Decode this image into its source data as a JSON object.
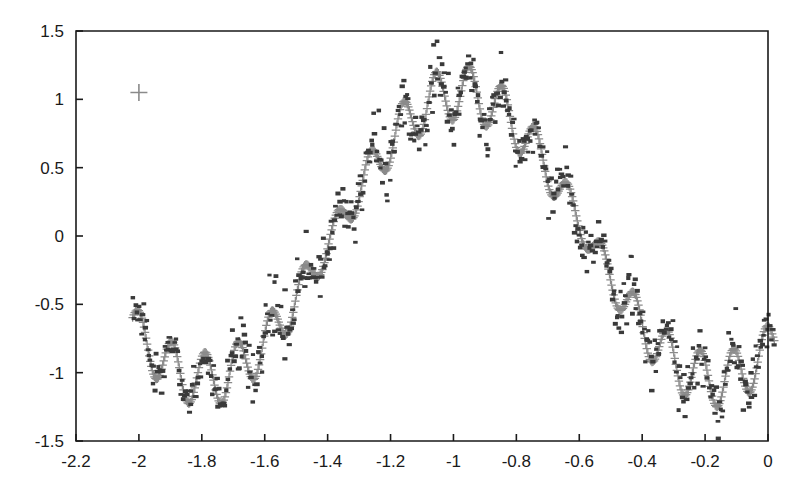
{
  "chart_data": {
    "type": "scatter",
    "title": "",
    "subtitle": "",
    "xlabel": "",
    "ylabel": "",
    "xlim": [
      -2.2,
      0
    ],
    "ylim": [
      -1.5,
      1.5
    ],
    "grid": false,
    "legend": "none",
    "x_ticks": [
      "-2.2",
      "-2",
      "-1.8",
      "-1.6",
      "-1.4",
      "-1.2",
      "-1",
      "-0.8",
      "-0.6",
      "-0.4",
      "-0.2",
      "0"
    ],
    "x_tick_values": [
      -2.2,
      -2,
      -1.8,
      -1.6,
      -1.4,
      -1.2,
      -1,
      -0.8,
      -0.6,
      -0.4,
      -0.2,
      0
    ],
    "y_ticks": [
      "1.5",
      "1",
      "0.5",
      "0",
      "-0.5",
      "-1",
      "-1.5"
    ],
    "y_tick_values": [
      1.5,
      1,
      0.5,
      0,
      -0.5,
      -1,
      -1.5
    ],
    "colors": {
      "fit_marker": "#8a8a8a",
      "data_marker": "#3a3a3a",
      "axis": "#1a1a1a",
      "background": "#ffffff"
    },
    "series": [
      {
        "name": "fitted-curve",
        "marker": "plus",
        "color": "#8a8a8a",
        "description": "Dense gray plus markers tracing an amplitude-modulated oscillation",
        "model": {
          "baseline_amplitude": 1.05,
          "baseline_period": 1.62,
          "baseline_phase_x0": -2.0,
          "baseline_offset": 0.0,
          "ripple_amplitude": 0.2,
          "ripple_period": 0.105,
          "n_points": 620,
          "x_start": -2.02,
          "x_end": 0.02
        }
      },
      {
        "name": "measured-data",
        "marker": "square",
        "color": "#3a3a3a",
        "description": "Dark square scatter points dispersed about the fitted curve",
        "model": {
          "n_points": 560,
          "noise_sigma": 0.11,
          "x_start": -2.02,
          "x_end": 0.02
        }
      }
    ],
    "annotations": [
      {
        "name": "isolated-plus-marker",
        "x": -2.0,
        "y": 1.05,
        "marker": "plus"
      }
    ],
    "key_features": [
      {
        "label": "left-rise",
        "x": -2.0,
        "y": 0.62
      },
      {
        "label": "global-max",
        "x": -1.82,
        "y": 1.3
      },
      {
        "label": "descent-shoulder",
        "x": -1.45,
        "y": 0.1
      },
      {
        "label": "mid-dip",
        "x": -1.22,
        "y": -1.35
      },
      {
        "label": "local-bump",
        "x": -1.05,
        "y": -0.62
      },
      {
        "label": "second-dip",
        "x": -0.85,
        "y": -1.32
      },
      {
        "label": "right-rise",
        "x": -0.5,
        "y": 0.0
      },
      {
        "label": "right-max",
        "x": -0.2,
        "y": 1.28
      },
      {
        "label": "right-edge",
        "x": -0.02,
        "y": 0.82
      }
    ]
  },
  "figure": {
    "plot_frame": {
      "left_px": 76,
      "right_px": 768,
      "top_px": 31,
      "bottom_px": 441
    }
  }
}
